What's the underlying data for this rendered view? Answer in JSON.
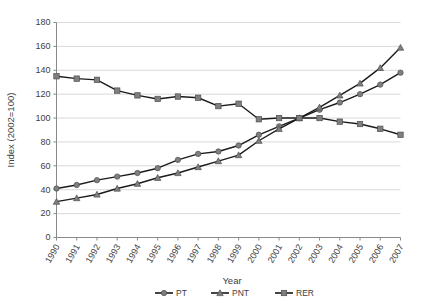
{
  "chart_data": {
    "type": "line",
    "title": "",
    "xlabel": "Year",
    "ylabel": "Index (2002=100)",
    "ylim": [
      0,
      180
    ],
    "ytick_step": 20,
    "yticks": [
      0,
      20,
      40,
      60,
      80,
      100,
      120,
      140,
      160,
      180
    ],
    "grid": true,
    "legend_position": "bottom",
    "categories": [
      1990,
      1991,
      1992,
      1993,
      1994,
      1995,
      1996,
      1997,
      1998,
      1999,
      2000,
      2001,
      2002,
      2003,
      2004,
      2005,
      2006,
      2007
    ],
    "x": [
      "1990",
      "1991",
      "1992",
      "1993",
      "1994",
      "1995",
      "1996",
      "1997",
      "1998",
      "1999",
      "2000",
      "2001",
      "2002",
      "2003",
      "2004",
      "2005",
      "2006",
      "2007"
    ],
    "series": [
      {
        "name": "PT",
        "marker": "circle",
        "values": [
          41,
          44,
          48,
          51,
          54,
          58,
          65,
          70,
          72,
          77,
          86,
          93,
          100,
          107,
          113,
          120,
          128,
          138
        ]
      },
      {
        "name": "PNT",
        "marker": "triangle",
        "values": [
          30,
          33,
          36,
          41,
          45,
          50,
          54,
          59,
          64,
          69,
          81,
          91,
          100,
          109,
          119,
          129,
          142,
          159
        ]
      },
      {
        "name": "RER",
        "marker": "square",
        "values": [
          135,
          133,
          132,
          123,
          119,
          116,
          118,
          117,
          110,
          112,
          99,
          100,
          100,
          100,
          97,
          95,
          91,
          86
        ]
      }
    ]
  },
  "legend": {
    "items": [
      {
        "label": "PT"
      },
      {
        "label": "PNT"
      },
      {
        "label": "RER"
      }
    ]
  },
  "axes": {
    "x_title": "Year",
    "y_title": "Index (2002=100)"
  }
}
